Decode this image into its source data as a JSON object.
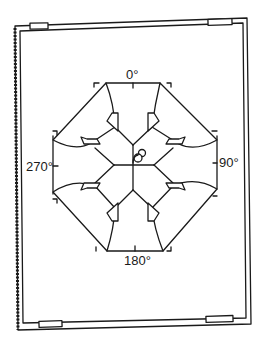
{
  "diagram": {
    "type": "compass-rosette-template-on-board",
    "labels": {
      "top": "0°",
      "right": "90°",
      "bottom": "180°",
      "left": "270°"
    },
    "board": {
      "clips": [
        "top-left",
        "top-right",
        "bottom-left",
        "bottom-right"
      ]
    },
    "colors": {
      "ink": "#1a1a1a",
      "paper": "#ffffff"
    }
  }
}
